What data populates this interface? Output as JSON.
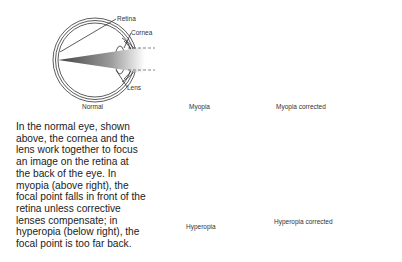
{
  "panels": {
    "normal": {
      "caption": "Normal"
    },
    "myopia": {
      "caption": "Myopia"
    },
    "myopia_corrected": {
      "caption": "Myopia corrected"
    },
    "hyperopia": {
      "caption": "Hyperopia"
    },
    "hyperopia_corrected": {
      "caption": "Hyperopia corrected"
    }
  },
  "callouts": {
    "retina": "Retina",
    "cornea": "Cornea",
    "lens": "Lens"
  },
  "description": {
    "lines": [
      "In the normal eye, shown",
      "above, the cornea and the",
      "lens work together to focus",
      "an image on the retina at",
      "the back of the eye. In",
      "myopia (above right), the",
      "focal point falls in front of the",
      "retina unless corrective",
      "lenses compensate; in",
      "hyperopia (below right), the",
      "focal point is too far back."
    ]
  },
  "colors": {
    "line": "#333333",
    "ray_dark": "#555555",
    "ray_light": "#ffffff"
  }
}
